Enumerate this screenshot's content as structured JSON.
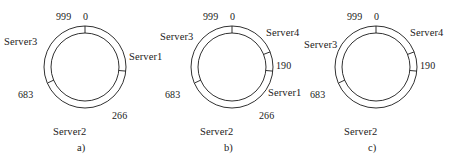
{
  "figure": {
    "type": "consistent-hashing-ring-diagram",
    "panel_count": 3,
    "ring": {
      "hash_space_min": 0,
      "hash_space_max": 999,
      "stroke_color": "#1a1a1a",
      "background_color": "#ffffff"
    },
    "panels": [
      {
        "id": "a",
        "caption": "a)",
        "tick_labels": [
          {
            "text": "999",
            "value": 999
          },
          {
            "text": "0",
            "value": 0
          },
          {
            "text": "266",
            "value": 266
          },
          {
            "text": "683",
            "value": 683
          }
        ],
        "server_labels": [
          {
            "text": "Server1"
          },
          {
            "text": "Server2"
          },
          {
            "text": "Server3"
          }
        ]
      },
      {
        "id": "b",
        "caption": "b)",
        "tick_labels": [
          {
            "text": "999",
            "value": 999
          },
          {
            "text": "0",
            "value": 0
          },
          {
            "text": "190",
            "value": 190
          },
          {
            "text": "266",
            "value": 266
          },
          {
            "text": "683",
            "value": 683
          }
        ],
        "server_labels": [
          {
            "text": "Server4"
          },
          {
            "text": "Server1"
          },
          {
            "text": "Server2"
          },
          {
            "text": "Server3"
          }
        ]
      },
      {
        "id": "c",
        "caption": "c)",
        "tick_labels": [
          {
            "text": "999",
            "value": 999
          },
          {
            "text": "0",
            "value": 0
          },
          {
            "text": "190",
            "value": 190
          },
          {
            "text": "683",
            "value": 683
          }
        ],
        "server_labels": [
          {
            "text": "Server4"
          },
          {
            "text": "Server3"
          },
          {
            "text": "Server2"
          }
        ]
      }
    ]
  }
}
